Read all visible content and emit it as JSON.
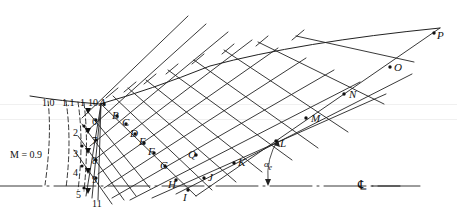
{
  "figure": {
    "type": "method-of-characteristics-nozzle-diagram",
    "background_color": "#ffffff",
    "line_color": "#222222",
    "width": 457,
    "height": 216
  },
  "mach_labels": [
    {
      "text": "M = 0.9",
      "x": 10,
      "y": 150
    },
    {
      "text": "1.0",
      "x": 42,
      "y": 98
    },
    {
      "text": "1.1",
      "x": 62,
      "y": 98
    },
    {
      "text": "1",
      "x": 80,
      "y": 98
    },
    {
      "text": "10",
      "x": 88,
      "y": 98
    }
  ],
  "point_labels": [
    {
      "text": "A",
      "x": 99,
      "y": 97
    },
    {
      "text": "B",
      "x": 112,
      "y": 110
    },
    {
      "text": "C",
      "x": 122,
      "y": 117
    },
    {
      "text": "D",
      "x": 130,
      "y": 128
    },
    {
      "text": "E",
      "x": 139,
      "y": 136
    },
    {
      "text": "F",
      "x": 148,
      "y": 146
    },
    {
      "text": "G",
      "x": 160,
      "y": 160
    },
    {
      "text": "H",
      "x": 168,
      "y": 179
    },
    {
      "text": "I",
      "x": 183,
      "y": 192
    },
    {
      "text": "J",
      "x": 208,
      "y": 172
    },
    {
      "text": "K",
      "x": 238,
      "y": 157
    },
    {
      "text": "L",
      "x": 280,
      "y": 138
    },
    {
      "text": "M",
      "x": 311,
      "y": 113
    },
    {
      "text": "N",
      "x": 349,
      "y": 89
    },
    {
      "text": "O",
      "x": 394,
      "y": 62
    },
    {
      "text": "P",
      "x": 437,
      "y": 30
    },
    {
      "text": "Q",
      "x": 188,
      "y": 149
    }
  ],
  "number_labels": [
    {
      "text": "1",
      "x": 80,
      "y": 98
    },
    {
      "text": "2",
      "x": 73,
      "y": 128
    },
    {
      "text": "3",
      "x": 73,
      "y": 149
    },
    {
      "text": "4",
      "x": 73,
      "y": 168
    },
    {
      "text": "5",
      "x": 76,
      "y": 190
    },
    {
      "text": "6",
      "x": 92,
      "y": 117
    },
    {
      "text": "7",
      "x": 92,
      "y": 136
    },
    {
      "text": "8",
      "x": 92,
      "y": 156
    },
    {
      "text": "9",
      "x": 92,
      "y": 175
    },
    {
      "text": "10",
      "x": 88,
      "y": 98
    },
    {
      "text": "11",
      "x": 92,
      "y": 199
    }
  ],
  "angle_label": {
    "text": "α",
    "subscript": "e",
    "x": 264,
    "y": 160
  },
  "centerline_label": {
    "text": "℄",
    "x": 358,
    "y": 178
  },
  "axis": {
    "centerline_y": 186,
    "centerline_x_start": 0,
    "centerline_x_end": 420
  }
}
